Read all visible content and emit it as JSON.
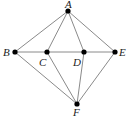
{
  "diagram": {
    "type": "graph",
    "nodes": [
      {
        "id": "A",
        "label": "A",
        "x": 68,
        "y": 11,
        "lx": 65,
        "ly": 7
      },
      {
        "id": "B",
        "label": "B",
        "x": 15,
        "y": 52,
        "lx": 3,
        "ly": 56
      },
      {
        "id": "C",
        "label": "C",
        "x": 47,
        "y": 52,
        "lx": 38,
        "ly": 66
      },
      {
        "id": "D",
        "label": "D",
        "x": 84,
        "y": 52,
        "lx": 73,
        "ly": 66
      },
      {
        "id": "E",
        "label": "E",
        "x": 115,
        "y": 52,
        "lx": 119,
        "ly": 56
      },
      {
        "id": "F",
        "label": "F",
        "x": 77,
        "y": 104,
        "lx": 73,
        "ly": 116
      }
    ],
    "edges": [
      [
        "A",
        "B"
      ],
      [
        "A",
        "C"
      ],
      [
        "A",
        "D"
      ],
      [
        "A",
        "E"
      ],
      [
        "B",
        "C"
      ],
      [
        "C",
        "D"
      ],
      [
        "D",
        "E"
      ],
      [
        "B",
        "F"
      ],
      [
        "C",
        "F"
      ],
      [
        "D",
        "F"
      ],
      [
        "E",
        "F"
      ]
    ],
    "colors": {
      "edge": "#8a8a8a",
      "node": "#000000",
      "label": "#222222"
    }
  }
}
